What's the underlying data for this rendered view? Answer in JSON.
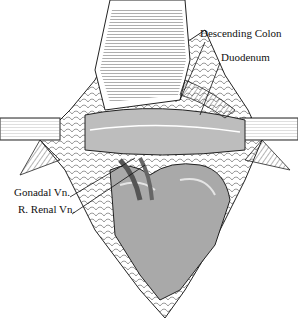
{
  "figure": {
    "labels": [
      {
        "id": "descending-colon",
        "text": "Descending Colon",
        "x": 200,
        "y": 33
      },
      {
        "id": "duodenum",
        "text": "Duodenum",
        "x": 221,
        "y": 57
      },
      {
        "id": "gonadal-vn",
        "text": "Gonadal Vn.",
        "x": 14,
        "y": 192
      },
      {
        "id": "r-renal-vn",
        "text": "R. Renal Vn.",
        "x": 18,
        "y": 209
      }
    ],
    "colors": {
      "ink": "#1a1a1a",
      "organ": "#a9a9a9",
      "organ_light": "#d4d4d4",
      "background": "#ffffff"
    }
  }
}
